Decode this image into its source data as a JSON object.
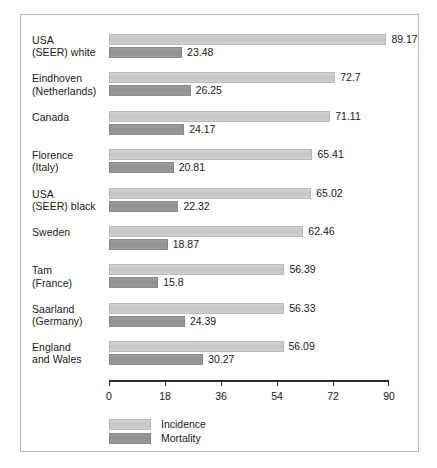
{
  "chart_data": {
    "type": "bar",
    "orientation": "horizontal",
    "title": "",
    "subtitle": "",
    "xlabel": "",
    "ylabel": "",
    "xlim": [
      0,
      90
    ],
    "xticks": [
      0,
      18,
      36,
      54,
      72,
      90
    ],
    "xtick_labels": [
      "0",
      "18",
      "36",
      "54",
      "72",
      "90"
    ],
    "grid": false,
    "legend_position": "bottom-left",
    "categories": [
      "USA\n(SEER) white",
      "Eindhoven\n(Netherlands)",
      "Canada",
      "Florence\n(Italy)",
      "USA\n(SEER) black",
      "Sweden",
      "Tam\n(France)",
      "Saarland\n(Germany)",
      "England\nand Wales"
    ],
    "series": [
      {
        "name": "Incidence",
        "color": "#c8c8c8",
        "values": [
          89.17,
          72.7,
          71.11,
          65.41,
          65.02,
          62.46,
          56.39,
          56.33,
          56.09
        ],
        "labels": [
          "89.17",
          "72.7",
          "71.11",
          "65.41",
          "65.02",
          "62.46",
          "56.39",
          "56.33",
          "56.09"
        ]
      },
      {
        "name": "Mortality",
        "color": "#969696",
        "values": [
          23.48,
          26.25,
          24.17,
          20.81,
          22.32,
          18.87,
          15.8,
          24.39,
          30.27
        ],
        "labels": [
          "23.48",
          "26.25",
          "24.17",
          "20.81",
          "22.32",
          "18.87",
          "15.8",
          "24.39",
          "30.27"
        ]
      }
    ]
  },
  "legend": {
    "entries": [
      {
        "label": "Incidence",
        "swatch": "incidence-swatch"
      },
      {
        "label": "Mortality",
        "swatch": "mortality-swatch"
      }
    ]
  },
  "colors": {
    "incidence": "#c8c8c8",
    "mortality": "#969696",
    "axis": "#2b2b2b",
    "border": "#b9b9b9",
    "text": "#1a1a1a",
    "background": "#ffffff"
  }
}
